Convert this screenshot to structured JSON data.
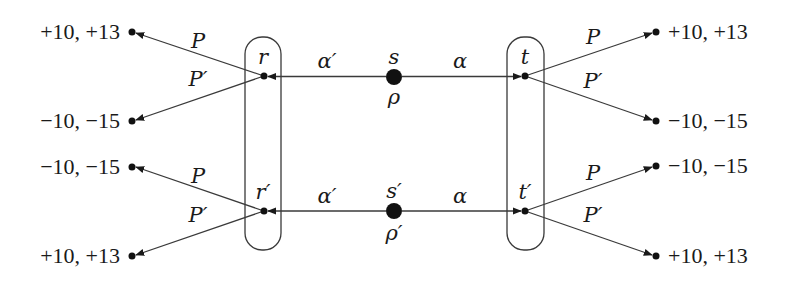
{
  "diagram": {
    "type": "extensive-form game tree",
    "chance_nodes": [
      {
        "id": "s",
        "label": "s",
        "prob_label": "ρ",
        "x": 394,
        "y": 77
      },
      {
        "id": "s_prime",
        "label": "s′",
        "prob_label": "ρ′",
        "x": 394,
        "y": 211
      }
    ],
    "decision_nodes": [
      {
        "id": "r",
        "label": "r",
        "x": 264,
        "y": 76
      },
      {
        "id": "t",
        "label": "t",
        "x": 525,
        "y": 76
      },
      {
        "id": "r_prime",
        "label": "r′",
        "x": 264,
        "y": 211
      },
      {
        "id": "t_prime",
        "label": "t′",
        "x": 525,
        "y": 211
      }
    ],
    "info_sets": [
      {
        "id": "left",
        "contains": [
          "r",
          "r_prime"
        ]
      },
      {
        "id": "right",
        "contains": [
          "t",
          "t_prime"
        ]
      }
    ],
    "signal_edges": [
      {
        "from": "s",
        "to": "r",
        "label": "α′"
      },
      {
        "from": "s",
        "to": "t",
        "label": "α"
      },
      {
        "from": "s_prime",
        "to": "r_prime",
        "label": "α′"
      },
      {
        "from": "s_prime",
        "to": "t_prime",
        "label": "α"
      }
    ],
    "action_edges": [
      {
        "from": "r",
        "label": "P",
        "payoff": "+10, +13"
      },
      {
        "from": "r",
        "label": "P′",
        "payoff": "−10, −15"
      },
      {
        "from": "t",
        "label": "P",
        "payoff": "+10, +13"
      },
      {
        "from": "t",
        "label": "P′",
        "payoff": "−10, −15"
      },
      {
        "from": "r_prime",
        "label": "P",
        "payoff": "−10, −15"
      },
      {
        "from": "r_prime",
        "label": "P′",
        "payoff": "+10, +13"
      },
      {
        "from": "t_prime",
        "label": "P",
        "payoff": "−10, −15"
      },
      {
        "from": "t_prime",
        "label": "P′",
        "payoff": "+10, +13"
      }
    ]
  }
}
